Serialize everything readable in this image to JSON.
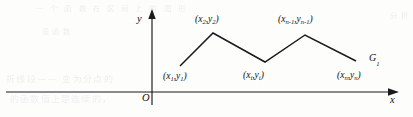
{
  "figure": {
    "kind": "piecewise-linear-graph",
    "background_color": "#fdfdfc",
    "ink_color": "#1a1a1a"
  },
  "axes": {
    "y_axis_label": "y",
    "x_axis_label": "x",
    "origin_label": "O",
    "x_axis_y_px": 92,
    "y_axis_x_px": 152
  },
  "curve": {
    "name_letter": "G",
    "name_subscript": "1",
    "points_px": "180,66 213,33 265,62 305,35 356,61"
  },
  "point_labels": [
    {
      "id": "p1",
      "base_x": "(x",
      "sub_x": "1",
      "mid": ",y",
      "sub_y": "1",
      "close": ")"
    },
    {
      "id": "p2",
      "base_x": "(x",
      "sub_x": "2",
      "mid": ",y",
      "sub_y": "2",
      "close": ")"
    },
    {
      "id": "pi",
      "base_x": "(x",
      "sub_x": "i",
      "mid": ",y",
      "sub_y": "i",
      "close": ")"
    },
    {
      "id": "pn1",
      "base_x": "(x",
      "sub_x": "n-1",
      "mid": ",y",
      "sub_y": "n-1",
      "close": ")"
    },
    {
      "id": "pn",
      "base_x": "(x",
      "sub_x": "n",
      "mid": ",y",
      "sub_y": "n",
      "close": ")"
    }
  ],
  "ghost_text": {
    "top": "一 个 函 数 在 区 间 上 的 图 形",
    "mid": "设 函 数",
    "low_left_1": "折线段——   变为分点的",
    "low_left_2": "的函数值上是连续的，",
    "right": "分 析"
  }
}
